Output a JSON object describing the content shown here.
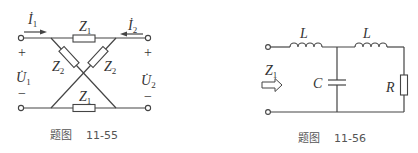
{
  "figures": [
    {
      "id": "fig-11-55",
      "caption": "题图    11-55",
      "labels": {
        "i1": "İ",
        "i1_sub": "1",
        "i2": "İ",
        "i2_sub": "2",
        "u1": "U̇",
        "u1_sub": "1",
        "u2": "U̇",
        "u2_sub": "2",
        "plus": "+",
        "minus": "−",
        "z": "Z",
        "z1_sub": "1",
        "z2_sub": "2"
      },
      "components": [
        "Z1 (top)",
        "Z1 (bottom)",
        "Z2 (diagonal left)",
        "Z2 (diagonal right)"
      ]
    },
    {
      "id": "fig-11-56",
      "caption": "题图    11-56",
      "labels": {
        "l": "L",
        "c": "C",
        "r": "R",
        "z": "Z",
        "z_sub": "1"
      },
      "components": [
        "L (series 1)",
        "C (shunt)",
        "L (series 2)",
        "R (load)"
      ]
    }
  ]
}
